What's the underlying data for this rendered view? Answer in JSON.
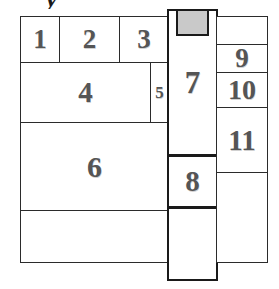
{
  "figure": {
    "title_fragment": "y",
    "colors": {
      "line": "#1a1a1a",
      "inner_line": "#2b2b2b",
      "label": "#555555",
      "highlight_fill": "#c9c9c9",
      "background": "#ffffff"
    },
    "cells": [
      {
        "id": "cell-1",
        "label": "1",
        "x": 20,
        "y": 16,
        "w": 40,
        "h": 47,
        "font": 27
      },
      {
        "id": "cell-2",
        "label": "2",
        "x": 59,
        "y": 16,
        "w": 61,
        "h": 47,
        "font": 27
      },
      {
        "id": "cell-3",
        "label": "3",
        "x": 119,
        "y": 16,
        "w": 50,
        "h": 47,
        "font": 27
      },
      {
        "id": "cell-4",
        "label": "4",
        "x": 20,
        "y": 62,
        "w": 131,
        "h": 61,
        "font": 29
      },
      {
        "id": "cell-5",
        "label": "5",
        "x": 150,
        "y": 62,
        "w": 19,
        "h": 61,
        "font": 17
      },
      {
        "id": "cell-6",
        "label": "6",
        "x": 20,
        "y": 122,
        "w": 149,
        "h": 89,
        "font": 30
      },
      {
        "id": "cell-6b",
        "label": "",
        "x": 20,
        "y": 210,
        "w": 149,
        "h": 53,
        "font": 20
      },
      {
        "id": "cell-7",
        "label": "7",
        "x": 167,
        "y": 9,
        "w": 51,
        "h": 147,
        "font": 31
      },
      {
        "id": "cell-8",
        "label": "8",
        "x": 167,
        "y": 155,
        "w": 51,
        "h": 53,
        "font": 29
      },
      {
        "id": "cell-8b",
        "label": "",
        "x": 167,
        "y": 207,
        "w": 51,
        "h": 74,
        "font": 20
      },
      {
        "id": "cell-9t",
        "label": "",
        "x": 216,
        "y": 16,
        "w": 52,
        "h": 29,
        "font": 20
      },
      {
        "id": "cell-9",
        "label": "9",
        "x": 216,
        "y": 44,
        "w": 52,
        "h": 29,
        "font": 27
      },
      {
        "id": "cell-10",
        "label": "10",
        "x": 216,
        "y": 72,
        "w": 52,
        "h": 36,
        "font": 28
      },
      {
        "id": "cell-11",
        "label": "11",
        "x": 216,
        "y": 107,
        "w": 52,
        "h": 66,
        "font": 29
      },
      {
        "id": "cell-11b",
        "label": "",
        "x": 216,
        "y": 172,
        "w": 52,
        "h": 91,
        "font": 20
      }
    ],
    "gray_box": {
      "id": "gray-box",
      "label": "",
      "x": 176,
      "y": 9,
      "w": 33,
      "h": 27
    }
  }
}
